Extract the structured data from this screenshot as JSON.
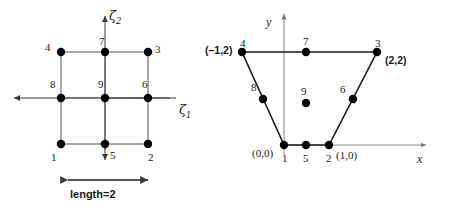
{
  "figure": {
    "stroke_color": "#3a3a3a",
    "node_color": "#000000",
    "axis_color": "#6b6b6b"
  },
  "left_panel": {
    "name": "parent-element-natural-coordinates",
    "axis_x_label": "ζ",
    "axis_x_sub": "1",
    "axis_y_label": "ζ",
    "axis_y_sub": "2",
    "length_label": "length=2",
    "nodes": [
      {
        "id": "1",
        "label": "1",
        "zeta1": -1,
        "zeta2": -1
      },
      {
        "id": "2",
        "label": "2",
        "zeta1": 1,
        "zeta2": -1
      },
      {
        "id": "3",
        "label": "3",
        "zeta1": 1,
        "zeta2": 1
      },
      {
        "id": "4",
        "label": "4",
        "zeta1": -1,
        "zeta2": 1
      },
      {
        "id": "5",
        "label": "5",
        "zeta1": 0,
        "zeta2": -1
      },
      {
        "id": "6",
        "label": "6",
        "zeta1": 1,
        "zeta2": 0
      },
      {
        "id": "7",
        "label": "7",
        "zeta1": 0,
        "zeta2": 1
      },
      {
        "id": "8",
        "label": "8",
        "zeta1": -1,
        "zeta2": 0
      },
      {
        "id": "9",
        "label": "9",
        "zeta1": 0,
        "zeta2": 0
      }
    ]
  },
  "right_panel": {
    "name": "physical-element-global-coordinates",
    "axis_x_label": "x",
    "axis_y_label": "y",
    "nodes": [
      {
        "id": "1",
        "label": "1",
        "x": 0,
        "y": 0,
        "coord_text": "(0,0)",
        "coord_style": "serif"
      },
      {
        "id": "2",
        "label": "2",
        "x": 1,
        "y": 0,
        "coord_text": "(1,0)",
        "coord_style": "serif"
      },
      {
        "id": "3",
        "label": "3",
        "x": 2,
        "y": 2,
        "coord_text": "(2,2)",
        "coord_style": "bold"
      },
      {
        "id": "4",
        "label": "4",
        "x": -1,
        "y": 2,
        "coord_text": "(–1,2)",
        "coord_style": "bold"
      },
      {
        "id": "5",
        "label": "5",
        "x": 0.5,
        "y": 0,
        "coord_text": "",
        "coord_style": ""
      },
      {
        "id": "6",
        "label": "6",
        "x": 1.5,
        "y": 1,
        "coord_text": "",
        "coord_style": ""
      },
      {
        "id": "7",
        "label": "7",
        "x": 0.5,
        "y": 2,
        "coord_text": "",
        "coord_style": ""
      },
      {
        "id": "8",
        "label": "8",
        "x": -0.5,
        "y": 1,
        "coord_text": "",
        "coord_style": ""
      },
      {
        "id": "9",
        "label": "9",
        "x": 0.5,
        "y": 1,
        "coord_text": "",
        "coord_style": ""
      }
    ]
  }
}
